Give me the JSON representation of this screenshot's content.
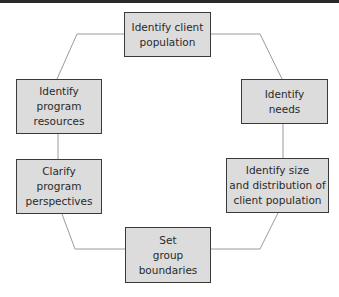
{
  "diagram": {
    "type": "cycle",
    "nodes": [
      {
        "id": "identify-client-population",
        "label": "Identify client\npopulation"
      },
      {
        "id": "identify-needs",
        "label": "Identify\nneeds"
      },
      {
        "id": "identify-size-distribution",
        "label": "Identify size\nand distribution of\nclient population"
      },
      {
        "id": "set-group-boundaries",
        "label": "Set\ngroup\nboundaries"
      },
      {
        "id": "clarify-program-perspectives",
        "label": "Clarify\nprogram\nperspectives"
      },
      {
        "id": "identify-program-resources",
        "label": "Identify\nprogram\nresources"
      }
    ],
    "edges": [
      [
        "identify-client-population",
        "identify-needs"
      ],
      [
        "identify-needs",
        "identify-size-distribution"
      ],
      [
        "identify-size-distribution",
        "set-group-boundaries"
      ],
      [
        "set-group-boundaries",
        "clarify-program-perspectives"
      ],
      [
        "clarify-program-perspectives",
        "identify-program-resources"
      ],
      [
        "identify-program-resources",
        "identify-client-population"
      ]
    ],
    "colors": {
      "box_fill": "#dcdcdc",
      "box_border": "#3a3a3a",
      "connector": "#9a9a9a",
      "top_bar": "#2a2a2a"
    }
  }
}
